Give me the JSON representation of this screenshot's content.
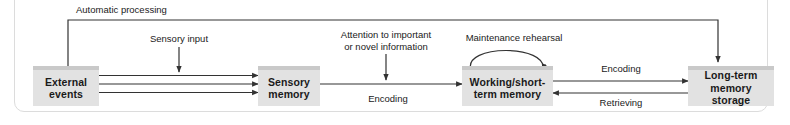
{
  "figure": {
    "nodes": [
      {
        "id": "external-events",
        "label": "External\nevents"
      },
      {
        "id": "sensory-memory",
        "label": "Sensory\nmemory"
      },
      {
        "id": "working-short-term-memory",
        "label": "Working/short-\nterm memory"
      },
      {
        "id": "long-term-memory-storage",
        "label": "Long-term\nmemory storage"
      }
    ],
    "edge_labels": [
      {
        "id": "automatic-processing",
        "text": "Automatic processing"
      },
      {
        "id": "sensory-input",
        "text": "Sensory input"
      },
      {
        "id": "attention",
        "text": "Attention to important\nor novel information"
      },
      {
        "id": "maintenance-rehearsal",
        "text": "Maintenance rehearsal"
      },
      {
        "id": "encoding-sensory-to-working",
        "text": "Encoding"
      },
      {
        "id": "encoding-working-to-longterm",
        "text": "Encoding"
      },
      {
        "id": "retrieving",
        "text": "Retrieving"
      }
    ],
    "colors": {
      "box_fill": "#e2e2e2",
      "box_top_bar": "#c9c9c9",
      "line": "#333333",
      "text": "#1a1a1a",
      "panel_border": "#dcdcdc",
      "background": "#ffffff"
    }
  }
}
